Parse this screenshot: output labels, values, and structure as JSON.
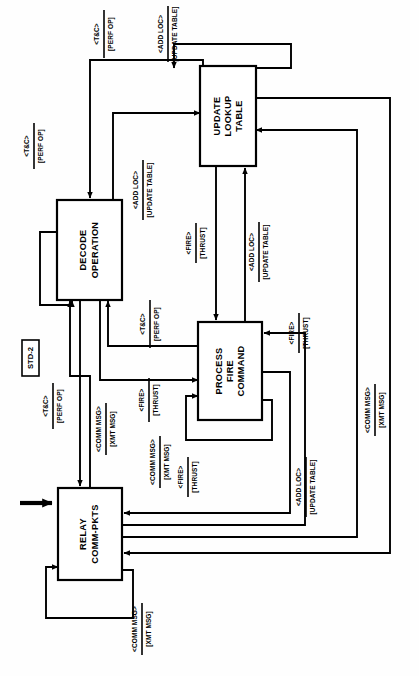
{
  "diagram": {
    "identifier": "STD-2",
    "type": "state-transition-diagram",
    "orientation": "rotated-90-ccw",
    "states": [
      {
        "id": "relay",
        "name": "RELAY\nCOMM-PKTS",
        "line1": "RELAY",
        "line2": "COMM-PKTS",
        "line3": ""
      },
      {
        "id": "decode",
        "name": "DECODE OPERATION",
        "line1": "DECODE",
        "line2": "OPERATION",
        "line3": ""
      },
      {
        "id": "update",
        "name": "UPDATE LOOKUP TABLE",
        "line1": "UPDATE",
        "line2": "LOOKUP",
        "line3": "TABLE"
      },
      {
        "id": "process",
        "name": "PROCESS FIRE COMMAND",
        "line1": "PROCESS",
        "line2": "FIRE",
        "line3": "COMMAND"
      }
    ],
    "transitions": [
      {
        "id": "t1",
        "from": "update",
        "to": "update",
        "condition": "<ADD LOC>",
        "action": "[UPDATE TABLE]"
      },
      {
        "id": "t2",
        "from": "update",
        "to": "decode",
        "condition": "<T&C>",
        "action": "[PERF OP]"
      },
      {
        "id": "t3",
        "from": "decode",
        "to": "decode",
        "condition": "<T&C>",
        "action": "[PERF OP]"
      },
      {
        "id": "t4",
        "from": "decode",
        "to": "update",
        "condition": "<ADD LOC>",
        "action": "[UPDATE TABLE]"
      },
      {
        "id": "t5",
        "from": "update",
        "to": "process",
        "condition": "<FIRE>",
        "action": "[THRUST]"
      },
      {
        "id": "t6",
        "from": "process",
        "to": "update",
        "condition": "<ADD LOC>",
        "action": "[UPDATE TABLE]"
      },
      {
        "id": "t7",
        "from": "process",
        "to": "decode",
        "condition": "<T&C>",
        "action": "[PERF OP]"
      },
      {
        "id": "t8",
        "from": "relay",
        "to": "decode",
        "condition": "<T&C>",
        "action": "[PERF OP]"
      },
      {
        "id": "t9",
        "from": "decode",
        "to": "relay",
        "condition": "<COMM MSG>",
        "action": "[XMT MSG]"
      },
      {
        "id": "t10",
        "from": "decode",
        "to": "process",
        "condition": "<FIRE>",
        "action": "[THRUST]"
      },
      {
        "id": "t11",
        "from": "process",
        "to": "relay",
        "condition": "<COMM MSG>",
        "action": "[XMT MSG]"
      },
      {
        "id": "t12",
        "from": "process",
        "to": "process",
        "condition": "<FIRE>",
        "action": "[THRUST]"
      },
      {
        "id": "t13",
        "from": "relay",
        "to": "process",
        "condition": "<FIRE>",
        "action": "[THRUST]"
      },
      {
        "id": "t14",
        "from": "relay",
        "to": "update",
        "condition": "<ADD LOC>",
        "action": "[UPDATE TABLE]"
      },
      {
        "id": "t15",
        "from": "update",
        "to": "relay",
        "condition": "<COMM MSG>",
        "action": "[XMT MSG]"
      },
      {
        "id": "t16",
        "from": "relay",
        "to": "relay",
        "condition": "<COMM MSG>",
        "action": "[XMT MSG]"
      }
    ],
    "entry_arrow": {
      "target": "relay",
      "label": ""
    }
  },
  "colors": {
    "stroke": "#000000",
    "fill": "#ffffff",
    "background": "#fefefe"
  }
}
